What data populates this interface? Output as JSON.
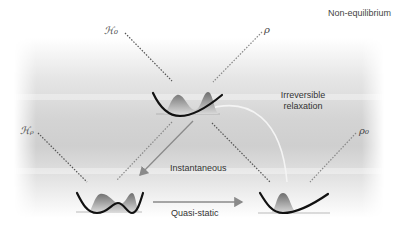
{
  "diagram": {
    "corner_label": "Non-equilibrium",
    "symbols": {
      "H0": "ℋ₀",
      "rho": "ρ",
      "Hrho": "ℋᵨ",
      "rho0": "ρ₀"
    },
    "arrows": {
      "instantaneous": "Instantaneous",
      "quasi_static": "Quasi-static",
      "irreversible_line1": "Irreversible",
      "irreversible_line2": "relaxation"
    },
    "states": [
      {
        "id": "top",
        "potential": "single-well",
        "distribution": "bimodal"
      },
      {
        "id": "bottom-left",
        "potential": "double-well",
        "distribution": "bimodal"
      },
      {
        "id": "bottom-right",
        "potential": "single-well",
        "distribution": "unimodal"
      }
    ],
    "colors": {
      "curve": "#111111",
      "arrow": "#8a8a8a",
      "dotted_dark": "#555555",
      "dotted_light": "#888888"
    }
  }
}
